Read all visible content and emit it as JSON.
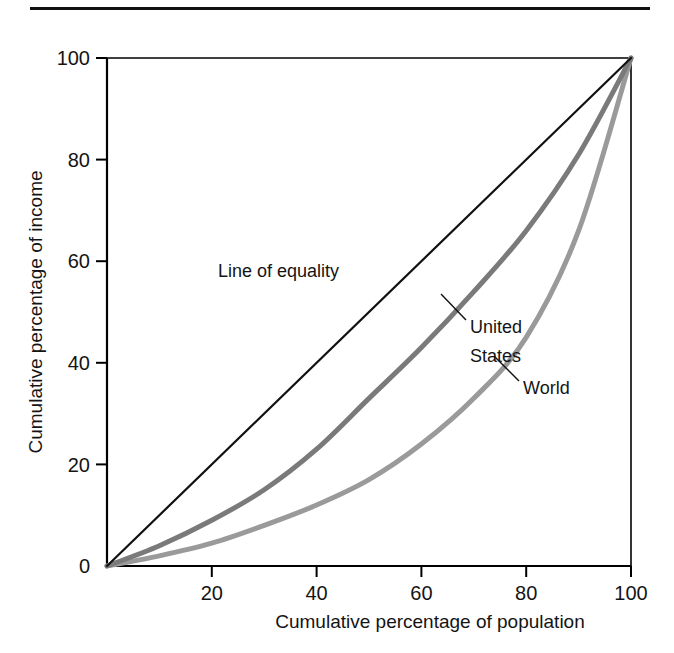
{
  "figure": {
    "top_rule": true,
    "background_color": "#ffffff",
    "frame_color": "#000000"
  },
  "chart_data": {
    "type": "line",
    "title": "",
    "subtitle": "",
    "xlabel": "Cumulative percentage of population",
    "ylabel": "Cumulative percentage of income",
    "xlim": [
      0,
      100
    ],
    "ylim": [
      0,
      100
    ],
    "xticks": [
      0,
      20,
      40,
      60,
      80,
      100
    ],
    "yticks": [
      0,
      20,
      40,
      60,
      80,
      100
    ],
    "xtick_labels": [
      "0",
      "20",
      "40",
      "60",
      "80",
      "100"
    ],
    "ytick_labels": [
      "0",
      "20",
      "40",
      "60",
      "80",
      "100"
    ],
    "grid": false,
    "legend": "inline-annotations",
    "x": [
      0,
      10,
      20,
      30,
      40,
      50,
      60,
      70,
      80,
      90,
      100
    ],
    "series": [
      {
        "name": "Line of equality",
        "color": "#111111",
        "width": 2.2,
        "values": [
          0,
          10,
          20,
          30,
          40,
          50,
          60,
          70,
          80,
          90,
          100
        ]
      },
      {
        "name": "United States",
        "color": "#7a7a7a",
        "width": 5,
        "values": [
          0,
          4,
          9,
          15,
          23,
          33,
          43,
          54,
          66,
          81,
          100
        ]
      },
      {
        "name": "World",
        "color": "#9a9a9a",
        "width": 5,
        "values": [
          0,
          2,
          4.5,
          8,
          12,
          17,
          24,
          33,
          45,
          66,
          100
        ]
      }
    ],
    "annotations": [
      {
        "name": "line-of-equality",
        "text": "Line of equality",
        "text_x": 218,
        "text_y": 277,
        "leader": null
      },
      {
        "name": "united-states",
        "text_lines": [
          "United States",
          "States"
        ],
        "text": "United",
        "text2": "States",
        "text_x": 472,
        "text_y": 326,
        "text2_y": 357,
        "leader": {
          "x1": 466,
          "y1": 319,
          "x2": 441,
          "y2": 294
        }
      },
      {
        "name": "world",
        "text": "World",
        "text_x": 523,
        "text_y": 387,
        "leader": {
          "x1": 517,
          "y1": 380,
          "x2": 492,
          "y2": 355
        }
      }
    ]
  },
  "axes": {
    "y_title": "Cumulative percentage of income",
    "x_title": "Cumulative percentage of population",
    "y_tick_labels": [
      {
        "value": 100,
        "label": "100"
      },
      {
        "value": 80,
        "label": "80"
      },
      {
        "value": 60,
        "label": "60"
      },
      {
        "value": 40,
        "label": "40"
      },
      {
        "value": 20,
        "label": "20"
      },
      {
        "value": 0,
        "label": "0"
      }
    ],
    "x_tick_labels": [
      {
        "value": 20,
        "label": "20"
      },
      {
        "value": 40,
        "label": "40"
      },
      {
        "value": 60,
        "label": "60"
      },
      {
        "value": 80,
        "label": "80"
      },
      {
        "value": 100,
        "label": "100"
      }
    ]
  }
}
